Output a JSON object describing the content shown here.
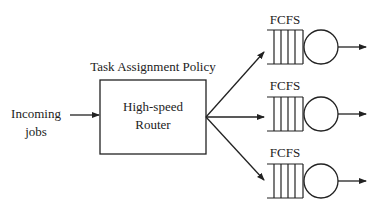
{
  "diagram": {
    "type": "queueing-system",
    "input_label": [
      "Incoming",
      "jobs"
    ],
    "policy_label": "Task Assignment Policy",
    "router_label": [
      "High-speed",
      "Router"
    ],
    "servers": [
      {
        "discipline": "FCFS",
        "cy": 47
      },
      {
        "discipline": "FCFS",
        "cy": 114
      },
      {
        "discipline": "FCFS",
        "cy": 181
      }
    ],
    "colors": {
      "stroke": "#222222",
      "background": "#ffffff"
    }
  }
}
